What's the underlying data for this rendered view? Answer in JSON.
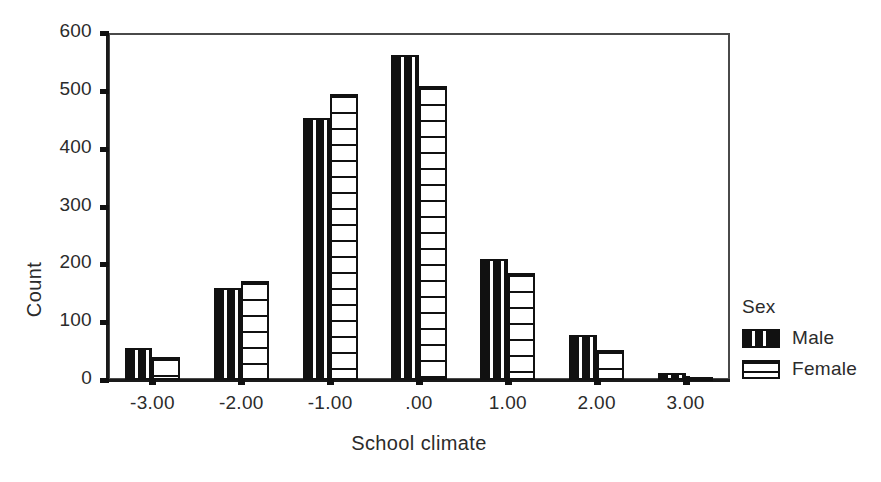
{
  "chart_data": {
    "type": "bar",
    "title": "",
    "subtitle": "",
    "xlabel": "School climate",
    "ylabel": "Count",
    "categories": [
      "-3.00",
      "-2.00",
      "-1.00",
      ".00",
      "1.00",
      "2.00",
      "3.00"
    ],
    "series": [
      {
        "name": "Male",
        "values": [
          55,
          159,
          453,
          562,
          209,
          78,
          12
        ]
      },
      {
        "name": "Female",
        "values": [
          39,
          171,
          494,
          508,
          185,
          52,
          2
        ]
      }
    ],
    "ylim": [
      0,
      600
    ],
    "yticks": [
      0,
      100,
      200,
      300,
      400,
      500,
      600
    ],
    "ytick_labels": [
      "0",
      "100",
      "200",
      "300",
      "400",
      "500",
      "600"
    ],
    "grid": false,
    "legend": {
      "title": "Sex",
      "position": "right",
      "entries": [
        {
          "label": "Male",
          "pattern": "black-vertical-stripes",
          "color": "#111111"
        },
        {
          "label": "Female",
          "pattern": "white-horizontal-lines",
          "color": "#ffffff"
        }
      ]
    },
    "axis_color": "#111111",
    "background": "#ffffff"
  }
}
